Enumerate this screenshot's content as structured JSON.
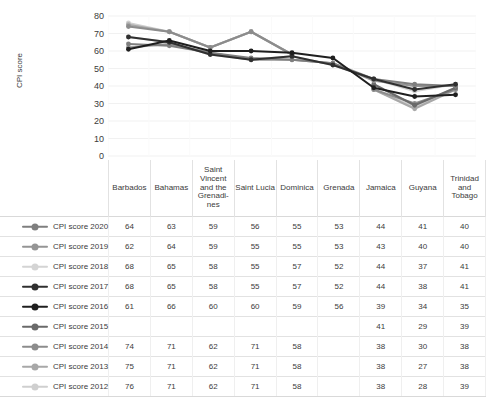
{
  "title_fragment": "",
  "chart_data": {
    "type": "line",
    "title": "",
    "xlabel": "",
    "ylabel": "CPI score",
    "ylim": [
      0,
      80
    ],
    "yticks": [
      80,
      70,
      60,
      50,
      40,
      30,
      20,
      10,
      0
    ],
    "grid": true,
    "legend_position": "table-left",
    "categories": [
      "Barbados",
      "Bahamas",
      "Saint Vincent and the Grenadi-nes",
      "Saint Lucia",
      "Dominica",
      "Grenada",
      "Jamaica",
      "Guyana",
      "Trinidad and Tobago"
    ],
    "series": [
      {
        "name": "CPI score 2020",
        "color": "#7f7f7f",
        "values": [
          64,
          63,
          59,
          56,
          55,
          53,
          44,
          41,
          40
        ]
      },
      {
        "name": "CPI score 2019",
        "color": "#959595",
        "values": [
          62,
          64,
          59,
          55,
          55,
          53,
          43,
          40,
          40
        ]
      },
      {
        "name": "CPI score 2018",
        "color": "#d4d4d4",
        "values": [
          68,
          65,
          58,
          55,
          57,
          52,
          44,
          37,
          41
        ]
      },
      {
        "name": "CPI score 2017",
        "color": "#303030",
        "values": [
          68,
          65,
          58,
          55,
          57,
          52,
          44,
          38,
          41
        ]
      },
      {
        "name": "CPI score 2016",
        "color": "#1f1f1f",
        "values": [
          61,
          66,
          60,
          60,
          59,
          56,
          39,
          34,
          35
        ]
      },
      {
        "name": "CPI score 2015",
        "color": "#6a6a6a",
        "values": [
          null,
          null,
          null,
          null,
          null,
          null,
          41,
          29,
          39
        ]
      },
      {
        "name": "CPI score 2014",
        "color": "#8c8c8c",
        "values": [
          74,
          71,
          62,
          71,
          58,
          null,
          38,
          30,
          38
        ]
      },
      {
        "name": "CPI score 2013",
        "color": "#a8a8a8",
        "values": [
          75,
          71,
          62,
          71,
          58,
          null,
          38,
          27,
          38
        ]
      },
      {
        "name": "CPI score 2012",
        "color": "#cfcfcf",
        "values": [
          76,
          71,
          62,
          71,
          58,
          null,
          38,
          28,
          39
        ]
      }
    ]
  },
  "table": {
    "columns": [
      "Barbados",
      "Bahamas",
      "Saint Vincent and the Grenadi-nes",
      "Saint Lucia",
      "Dominica",
      "Grenada",
      "Jamaica",
      "Guyana",
      "Trinidad and Tobago"
    ],
    "rows": [
      {
        "label": "CPI score 2020",
        "cells": [
          "64",
          "63",
          "59",
          "56",
          "55",
          "53",
          "44",
          "41",
          "40"
        ]
      },
      {
        "label": "CPI score 2019",
        "cells": [
          "62",
          "64",
          "59",
          "55",
          "55",
          "53",
          "43",
          "40",
          "40"
        ]
      },
      {
        "label": "CPI score 2018",
        "cells": [
          "68",
          "65",
          "58",
          "55",
          "57",
          "52",
          "44",
          "37",
          "41"
        ]
      },
      {
        "label": "CPI score 2017",
        "cells": [
          "68",
          "65",
          "58",
          "55",
          "57",
          "52",
          "44",
          "38",
          "41"
        ]
      },
      {
        "label": "CPI score 2016",
        "cells": [
          "61",
          "66",
          "60",
          "60",
          "59",
          "56",
          "39",
          "34",
          "35"
        ]
      },
      {
        "label": "CPI score 2015",
        "cells": [
          "",
          "",
          "",
          "",
          "",
          "",
          "41",
          "29",
          "39"
        ]
      },
      {
        "label": "CPI score 2014",
        "cells": [
          "74",
          "71",
          "62",
          "71",
          "58",
          "",
          "38",
          "30",
          "38"
        ]
      },
      {
        "label": "CPI score 2013",
        "cells": [
          "75",
          "71",
          "62",
          "71",
          "58",
          "",
          "38",
          "27",
          "38"
        ]
      },
      {
        "label": "CPI score 2012",
        "cells": [
          "76",
          "71",
          "62",
          "71",
          "58",
          "",
          "38",
          "28",
          "39"
        ]
      }
    ]
  }
}
